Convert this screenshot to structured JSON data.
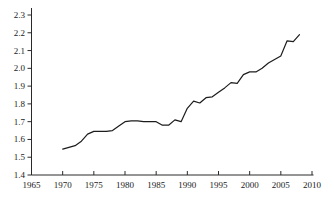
{
  "chart_data": {
    "type": "line",
    "title": "",
    "xlabel": "",
    "ylabel": "",
    "xlim": [
      1965,
      2010
    ],
    "ylim": [
      1.4,
      2.3
    ],
    "x_ticks": [
      1965,
      1970,
      1975,
      1980,
      1985,
      1990,
      1995,
      2000,
      2005,
      2010
    ],
    "y_ticks": [
      1.4,
      1.5,
      1.6,
      1.7,
      1.8,
      1.9,
      2.0,
      2.1,
      2.2,
      2.3
    ],
    "y_tick_decimals": 1,
    "grid": false,
    "legend_position": "none",
    "series": [
      {
        "name": "trend",
        "x": [
          1970,
          1971,
          1972,
          1973,
          1974,
          1975,
          1976,
          1977,
          1978,
          1979,
          1980,
          1981,
          1982,
          1983,
          1984,
          1985,
          1986,
          1987,
          1988,
          1989,
          1990,
          1991,
          1992,
          1993,
          1994,
          1995,
          1996,
          1997,
          1998,
          1999,
          2000,
          2001,
          2002,
          2003,
          2004,
          2005,
          2006,
          2007,
          2008
        ],
        "values": [
          1.545,
          1.555,
          1.565,
          1.59,
          1.63,
          1.645,
          1.645,
          1.645,
          1.65,
          1.675,
          1.7,
          1.705,
          1.705,
          1.7,
          1.7,
          1.7,
          1.68,
          1.68,
          1.71,
          1.7,
          1.775,
          1.815,
          1.805,
          1.835,
          1.84,
          1.865,
          1.89,
          1.92,
          1.915,
          1.965,
          1.98,
          1.98,
          2.0,
          2.03,
          2.05,
          2.07,
          2.155,
          2.15,
          2.19
        ]
      }
    ]
  },
  "colors": {
    "background": "#ffffff",
    "axis": "#2a2a2a",
    "line": "#1c1c1c",
    "tick_label": "#1a1a1a"
  }
}
